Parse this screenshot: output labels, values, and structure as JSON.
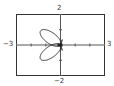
{
  "chart_data": {
    "type": "line",
    "title": "",
    "xlim": [
      -3,
      3
    ],
    "ylim": [
      -2,
      2
    ],
    "x_tick_step": 1,
    "y_tick_step": 1,
    "grid": false,
    "tick_labels": {
      "xmin": "−3",
      "xmax": "3",
      "ymin": "−2",
      "ymax": "2"
    },
    "petals": [
      {
        "tip": [
          -1.36,
          0.92
        ],
        "width": 0.45
      },
      {
        "tip": [
          -1.36,
          -0.92
        ],
        "width": 0.45
      },
      {
        "tip": [
          0.12,
          0.35
        ],
        "width": 0.08
      },
      {
        "tip": [
          0.12,
          -0.35
        ],
        "width": 0.08
      }
    ],
    "colors": {
      "curve": "#222222",
      "axes": "#555555",
      "frame": "#333333"
    }
  }
}
